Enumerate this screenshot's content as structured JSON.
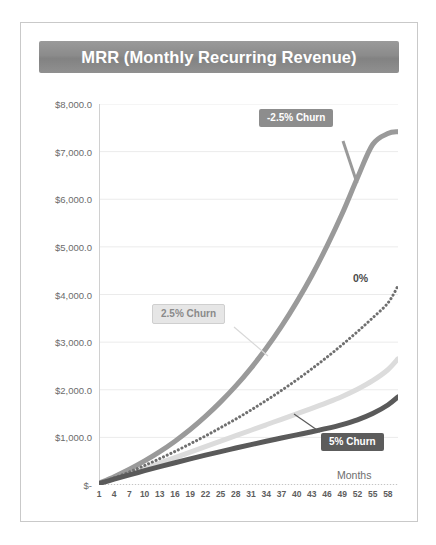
{
  "chart_data": {
    "type": "line",
    "title": "MRR (Monthly Recurring Revenue)",
    "xlabel": "Months",
    "ylabel": "",
    "xlim": [
      1,
      60
    ],
    "ylim": [
      0,
      8000
    ],
    "grid": true,
    "legend_position": "inline-callouts",
    "y_tick_labels": [
      "$8,000.0",
      "$7,000.0",
      "$6,000.0",
      "$5,000.0",
      "$4,000.0",
      "$3,000.0",
      "$2,000.0",
      "$1,000.0",
      "$-"
    ],
    "y_tick_values": [
      8000,
      7000,
      6000,
      5000,
      4000,
      3000,
      2000,
      1000,
      0
    ],
    "x_tick_labels": [
      "1",
      "4",
      "7",
      "10",
      "13",
      "16",
      "19",
      "22",
      "25",
      "28",
      "31",
      "34",
      "37",
      "40",
      "43",
      "46",
      "49",
      "52",
      "55",
      "58"
    ],
    "x_tick_values": [
      1,
      4,
      7,
      10,
      13,
      16,
      19,
      22,
      25,
      28,
      31,
      34,
      37,
      40,
      43,
      46,
      49,
      52,
      55,
      58
    ],
    "x": [
      1,
      4,
      7,
      10,
      13,
      16,
      19,
      22,
      25,
      28,
      31,
      34,
      37,
      40,
      43,
      46,
      49,
      52,
      55,
      58,
      60
    ],
    "series": [
      {
        "name": "-2.5% Churn",
        "label": "-2.5% Churn",
        "style": "solid",
        "color": "#9a9a9a",
        "width": 5,
        "values": [
          40,
          175,
          330,
          505,
          700,
          920,
          1165,
          1440,
          1745,
          2080,
          2455,
          2870,
          3330,
          3840,
          4400,
          5020,
          5700,
          6450,
          7150,
          7380,
          7420
        ]
      },
      {
        "name": "0%",
        "label": "0%",
        "style": "dotted",
        "color": "#6f6f6f",
        "width": 3,
        "values": [
          35,
          150,
          275,
          410,
          555,
          705,
          865,
          1030,
          1205,
          1385,
          1575,
          1775,
          1985,
          2205,
          2440,
          2685,
          2945,
          3220,
          3510,
          3820,
          4180
        ]
      },
      {
        "name": "2.5% Churn",
        "label": "2.5% Churn",
        "style": "solid",
        "color": "#dcdcdc",
        "width": 5,
        "values": [
          32,
          135,
          240,
          350,
          462,
          575,
          690,
          805,
          920,
          1035,
          1150,
          1265,
          1380,
          1495,
          1610,
          1730,
          1860,
          2010,
          2190,
          2420,
          2650
        ]
      },
      {
        "name": "5% Churn",
        "label": "5% Churn",
        "style": "solid",
        "color": "#5a5a5a",
        "width": 5,
        "values": [
          30,
          122,
          212,
          300,
          385,
          468,
          548,
          626,
          702,
          776,
          848,
          918,
          986,
          1052,
          1118,
          1188,
          1268,
          1368,
          1500,
          1680,
          1850
        ]
      }
    ],
    "annotations": [
      {
        "text": "-2.5% Churn",
        "style": "dark-box"
      },
      {
        "text": "0%",
        "style": "plain-bold"
      },
      {
        "text": "2.5% Churn",
        "style": "light-box"
      },
      {
        "text": "5% Churn",
        "style": "darkest-box"
      },
      {
        "text": "Months",
        "style": "axis-caption"
      }
    ],
    "colors": {
      "banner": "#8b8b8b",
      "banner_text": "#ffffff",
      "grid": "#ebebeb",
      "axis": "#d0d0d0",
      "tick_text": "#6b6b6b",
      "card_border": "#c9c9c9"
    }
  }
}
